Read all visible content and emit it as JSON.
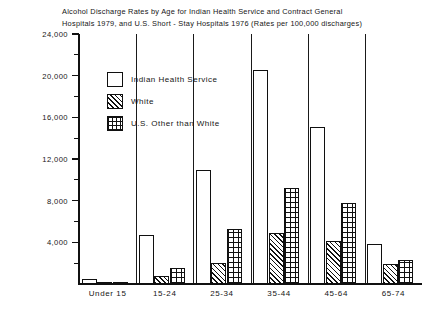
{
  "chart_data": {
    "type": "bar",
    "title": "Alcohol Discharge Rates by Age for Indian Health Service and Contract General\nHospitals 1979, and U.S. Short - Stay Hospitals 1976 (Rates per 100,000 discharges)",
    "xlabel": "",
    "ylabel": "",
    "ylim": [
      0,
      24000
    ],
    "grid": false,
    "legend_position": "inside-upper-left",
    "ytick_labels": [
      "4,000",
      "8,000",
      "12,000",
      "16,000",
      "20,000",
      "24,000"
    ],
    "ytick_values": [
      4000,
      8000,
      12000,
      16000,
      20000,
      24000
    ],
    "yminor_values": [
      2000,
      6000,
      10000,
      14000,
      18000,
      22000
    ],
    "categories": [
      "Under 15",
      "15-24",
      "25-34",
      "35-44",
      "45-64",
      "65-74"
    ],
    "series": [
      {
        "name": "Indian Health Service",
        "pattern": "solid-white",
        "values": [
          500,
          4700,
          10900,
          20500,
          15100,
          3800
        ]
      },
      {
        "name": "White",
        "pattern": "diagonal-hatch",
        "values": [
          150,
          800,
          2000,
          4900,
          4100,
          1900
        ]
      },
      {
        "name": "U.S. Other than White",
        "pattern": "cross-hatch-grid",
        "values": [
          200,
          1500,
          5300,
          9200,
          7800,
          2300
        ]
      }
    ],
    "colors": {
      "axis": "#111111",
      "bar_outline": "#101010",
      "bar_fill": "#ffffff",
      "background": "#ffffff",
      "text": "#151515"
    }
  },
  "legend": {
    "items": [
      {
        "label": "Indian Health Service"
      },
      {
        "label": "White"
      },
      {
        "label": "U.S. Other than White"
      }
    ]
  }
}
